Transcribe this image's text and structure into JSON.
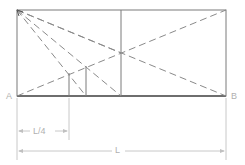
{
  "diagram": {
    "labels": {
      "point_a": "A",
      "point_b": "B",
      "quarter_length": "L/4",
      "total_length": "L"
    },
    "colors": {
      "frame": "#6e6e6e",
      "dashed": "#8a8a8a",
      "dimension": "#c4c4c4",
      "label": "#b0b0b0"
    }
  }
}
